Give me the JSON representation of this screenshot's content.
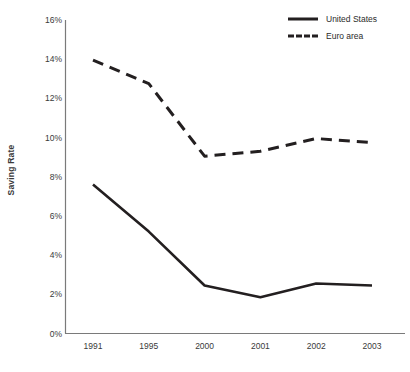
{
  "chart_data": {
    "type": "line",
    "title": "",
    "subtitle": "",
    "xlabel": "",
    "ylabel": "Saving Rate",
    "categories": [
      "1991",
      "1995",
      "2000",
      "2001",
      "2002",
      "2003"
    ],
    "series": [
      {
        "name": "United States",
        "style": "solid",
        "color": "#231f20",
        "values": [
          7.6,
          5.2,
          2.45,
          1.85,
          2.55,
          2.45
        ]
      },
      {
        "name": "Euro area",
        "style": "dashed",
        "color": "#231f20",
        "values": [
          13.95,
          12.75,
          9.05,
          9.3,
          9.95,
          9.75
        ]
      }
    ],
    "ylim": [
      0,
      16
    ],
    "ytick_step": 2,
    "ytick_labels": [
      "0%",
      "2%",
      "4%",
      "6%",
      "8%",
      "10%",
      "12%",
      "14%",
      "16%"
    ],
    "ytick_values": [
      0,
      2,
      4,
      6,
      8,
      10,
      12,
      14,
      16
    ],
    "grid": false,
    "legend_position": "top-right",
    "annotations": []
  },
  "axes": {
    "y_title": "Saving Rate"
  },
  "legend": {
    "entries": [
      {
        "label": "United States",
        "style": "solid"
      },
      {
        "label": "Euro area",
        "style": "dashed"
      }
    ]
  }
}
